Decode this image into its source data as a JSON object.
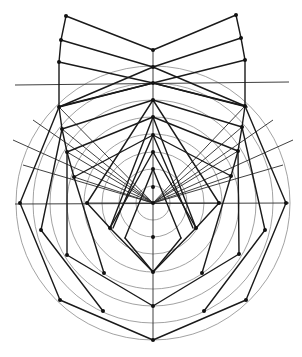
{
  "diagram": {
    "title": "",
    "colors": {
      "background": "#ffffff",
      "lines": "#1a1a1a",
      "circles": "#8a8a8a",
      "points": "#111111"
    },
    "center": [
      153,
      203
    ],
    "circle_radii": [
      17,
      34,
      51,
      69,
      86,
      103,
      120,
      137
    ],
    "axis": {
      "x": 153,
      "y_top": 50,
      "y_bottom": 340
    },
    "horizontal_lines": [
      {
        "x1": 15,
        "y1": 85,
        "x2": 289,
        "y2": 82
      },
      {
        "x1": 15,
        "y1": 204,
        "x2": 289,
        "y2": 203
      }
    ],
    "axis_points": [
      50,
      67,
      83,
      100,
      117,
      135,
      152,
      169,
      187,
      203,
      237,
      272,
      306,
      340
    ],
    "left_points": [
      [
        66,
        16
      ],
      [
        61,
        40
      ],
      [
        59,
        62
      ],
      [
        59,
        107
      ],
      [
        62,
        129
      ],
      [
        67,
        152
      ],
      [
        74,
        177
      ],
      [
        87,
        203
      ],
      [
        20,
        203
      ],
      [
        41,
        230
      ],
      [
        67,
        255
      ],
      [
        110,
        228
      ],
      [
        104,
        273
      ],
      [
        60,
        300
      ],
      [
        103,
        311
      ]
    ],
    "right_points": [
      [
        236,
        15
      ],
      [
        241,
        38
      ],
      [
        245,
        60
      ],
      [
        245,
        106
      ],
      [
        242,
        127
      ],
      [
        238,
        151
      ],
      [
        231,
        176
      ],
      [
        219,
        203
      ],
      [
        286,
        203
      ],
      [
        265,
        230
      ],
      [
        239,
        254
      ],
      [
        196,
        228
      ],
      [
        202,
        273
      ],
      [
        246,
        300
      ],
      [
        204,
        311
      ]
    ]
  }
}
